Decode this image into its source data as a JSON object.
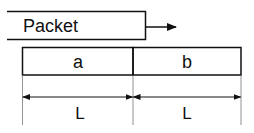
{
  "packet": {
    "label": "Packet",
    "direction_arrow": "right-arrow"
  },
  "fields": [
    {
      "label": "a"
    },
    {
      "label": "b"
    }
  ],
  "dimensions": [
    {
      "label": "L"
    },
    {
      "label": "L"
    }
  ],
  "colors": {
    "stroke": "#111111",
    "thin_stroke": "#777777",
    "background": "#ffffff"
  }
}
